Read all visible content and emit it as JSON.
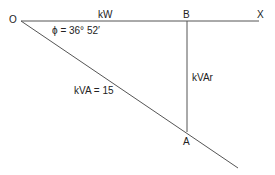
{
  "diagram": {
    "type": "power-triangle",
    "points": {
      "O": "O",
      "B": "B",
      "X": "X",
      "A": "A"
    },
    "labels": {
      "kw": "kW",
      "kvar": "kVAr",
      "kva": "kVA = 15",
      "angle": "ϕ = 36° 52′"
    },
    "colors": {
      "line": "#555555",
      "text": "#222222"
    }
  }
}
